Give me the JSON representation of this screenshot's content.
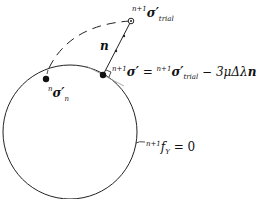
{
  "diagram": {
    "colors": {
      "stroke": "#222222",
      "tangent": "#999999",
      "background": "#ffffff"
    },
    "labels": {
      "trial_stress": {
        "sup": "n+1",
        "sym": "σ′",
        "sub": "trial"
      },
      "normal_vector": {
        "sym": "n"
      },
      "updated_stress": {
        "lhs_sup": "n+1",
        "lhs_sym": "σ′",
        "eq": "=",
        "rhs_sup": "n+1",
        "rhs_sym": "σ′",
        "rhs_sub": "trial",
        "minus": "−",
        "coef": "3μΔλ",
        "vec": "n"
      },
      "previous_stress": {
        "sup": "n",
        "sym": "σ′",
        "sub": "n"
      },
      "yield_surface": {
        "sup": "n+1",
        "sym": "f",
        "sub": "Y",
        "eq": "= 0"
      }
    }
  }
}
